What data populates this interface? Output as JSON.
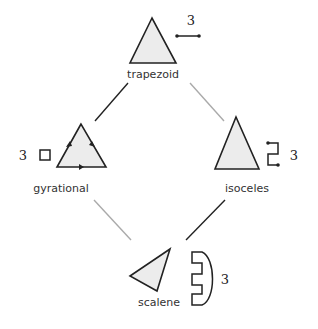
{
  "diagram": {
    "nodes": [
      {
        "id": "trapezoid",
        "label": "trapezoid",
        "count": "3",
        "glyph": "segment"
      },
      {
        "id": "gyrational",
        "label": "gyrational",
        "count": "3",
        "glyph": "square"
      },
      {
        "id": "isoceles",
        "label": "isoceles",
        "count": "3",
        "glyph": "zigzag"
      },
      {
        "id": "scalene",
        "label": "scalene",
        "count": "3",
        "glyph": "comb"
      }
    ],
    "edges": [
      {
        "from": "trapezoid",
        "to": "gyrational",
        "style": "dark",
        "color": "#222222"
      },
      {
        "from": "trapezoid",
        "to": "isoceles",
        "style": "light",
        "color": "#aaaaaa"
      },
      {
        "from": "gyrational",
        "to": "scalene",
        "style": "light",
        "color": "#aaaaaa"
      },
      {
        "from": "isoceles",
        "to": "scalene",
        "style": "dark",
        "color": "#222222"
      }
    ]
  }
}
